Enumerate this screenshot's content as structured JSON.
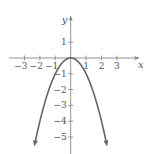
{
  "chart_data": {
    "type": "line",
    "title": "",
    "xlabel": "x",
    "ylabel": "y",
    "function": "y = -x^2",
    "xlim": [
      -3.5,
      3.8
    ],
    "ylim": [
      -6,
      2
    ],
    "x_ticks": [
      -3,
      -2,
      -1,
      1,
      2,
      3
    ],
    "x_tick_labels": [
      "−3",
      "−2",
      "−1",
      "1",
      "2",
      "3"
    ],
    "y_ticks": [
      1,
      -1,
      -2,
      -3,
      -4,
      -5
    ],
    "y_tick_labels": [
      "1",
      "−1",
      "−2",
      "−3",
      "−4",
      "−5"
    ],
    "grid": false,
    "legend": null,
    "series": [
      {
        "name": "y = -x^2",
        "x": [
          -2.35,
          -2,
          -1.5,
          -1,
          -0.5,
          0,
          0.5,
          1,
          1.5,
          2,
          2.35
        ],
        "y": [
          -5.52,
          -4,
          -2.25,
          -1,
          -0.25,
          0,
          -0.25,
          -1,
          -2.25,
          -4,
          -5.52
        ],
        "arrows_at_ends": true
      }
    ],
    "colors": {
      "axis": "#777777",
      "curve": "#666666",
      "text": "#555555"
    }
  }
}
